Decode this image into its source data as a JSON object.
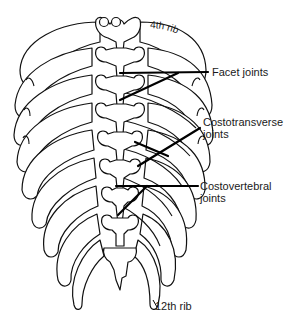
{
  "diagram": {
    "labels": {
      "rib_4th": "4th rib",
      "facet_joints": "Facet joints",
      "costotransverse_line1": "Costotransverse",
      "costotransverse_line2": "joints",
      "costovertebral_line1": "Costovertebral",
      "costovertebral_line2": "joints",
      "rib_12th": "12th rib"
    },
    "colors": {
      "line": "#111111",
      "background": "#ffffff",
      "text": "#1a1a1a"
    }
  }
}
